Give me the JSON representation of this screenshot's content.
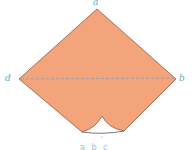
{
  "diagram": {
    "type": "folded-paper-shape",
    "fill_color": "#f4a47a",
    "outline_color": "#8a5a3c",
    "label_color": "#5fa5c4",
    "fold_line_color": "#7f9fc0",
    "vertices": {
      "a": {
        "label": "a",
        "x": 97,
        "y": 9
      },
      "b": {
        "label": "b",
        "x": 176,
        "y": 79
      },
      "d": {
        "label": "d",
        "x": 19,
        "y": 79
      }
    },
    "fold_line": {
      "from": "d",
      "to": "b",
      "style": "dashed"
    },
    "caption": "a b c"
  }
}
